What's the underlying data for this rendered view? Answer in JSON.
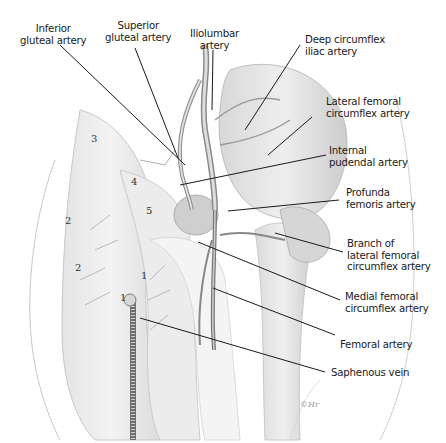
{
  "figure": {
    "labels": {
      "inferior_gluteal": "Inferior\ngluteal artery",
      "superior_gluteal": "Superior\ngluteal artery",
      "iliolumbar": "Iliolumbar\nartery",
      "deep_circumflex_iliac": "Deep circumflex\niliac artery",
      "lateral_femoral_circumflex": "Lateral femoral\ncircumflex artery",
      "internal_pudendal": "Internal\npudendal artery",
      "profunda_femoris": "Profunda\nfemoris artery",
      "branch_lateral_femoral_circumflex": "Branch of\nlateral femoral\ncircumflex artery",
      "medial_femoral_circumflex": "Medial femoral\ncircumflex artery",
      "femoral_artery": "Femoral artery",
      "saphenous_vein": "Saphenous vein"
    },
    "numbers": {
      "n3": "3",
      "n4": "4",
      "n5": "5",
      "n2a": "2",
      "n2b": "2",
      "n1a": "1",
      "n1b": "1"
    },
    "signature": "©Hr"
  }
}
